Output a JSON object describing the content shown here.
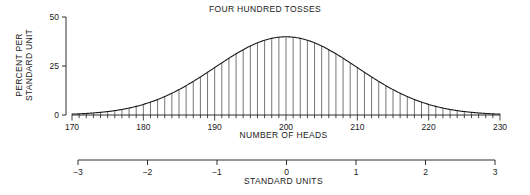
{
  "chart_data": {
    "type": "bar",
    "title": "FOUR HUNDRED TOSSES",
    "xlabel": "NUMBER OF HEADS",
    "ylabel": "PERCENT PER STANDARD UNIT",
    "ylabel_line1": "PERCENT PER",
    "ylabel_line2": "STANDARD UNIT",
    "secondary_xlabel": "STANDARD UNITS",
    "grid": false,
    "legend": "none",
    "xlim": [
      170,
      230
    ],
    "ylim": [
      0,
      50
    ],
    "secondary_xlim": [
      -3,
      3
    ],
    "x_ticks": [
      170,
      180,
      190,
      200,
      210,
      220,
      230
    ],
    "x_tick_labels": [
      "170",
      "180",
      "190",
      "200",
      "210",
      "220",
      "230"
    ],
    "x_minor_tick_step": 1,
    "y_ticks": [
      0,
      25,
      50
    ],
    "y_tick_labels": [
      "0",
      "25",
      "50"
    ],
    "secondary_x_ticks": [
      -3,
      -2,
      -1,
      0,
      1,
      2,
      3
    ],
    "secondary_x_tick_labels": [
      "−3",
      "−2",
      "−1",
      "0",
      "1",
      "2",
      "3"
    ],
    "distribution": {
      "name": "normal-approximation-binomial",
      "mean_heads": 200,
      "sd_heads": 10,
      "n_tosses": 400,
      "bar_width_heads": 1,
      "peak_value": 39.9
    },
    "categories": [
      170,
      171,
      172,
      173,
      174,
      175,
      176,
      177,
      178,
      179,
      180,
      181,
      182,
      183,
      184,
      185,
      186,
      187,
      188,
      189,
      190,
      191,
      192,
      193,
      194,
      195,
      196,
      197,
      198,
      199,
      200,
      201,
      202,
      203,
      204,
      205,
      206,
      207,
      208,
      209,
      210,
      211,
      212,
      213,
      214,
      215,
      216,
      217,
      218,
      219,
      220,
      221,
      222,
      223,
      224,
      225,
      226,
      227,
      228,
      229,
      230
    ],
    "values": [
      0.44,
      0.6,
      0.79,
      1.04,
      1.36,
      1.75,
      2.24,
      2.83,
      3.55,
      4.4,
      5.4,
      6.56,
      7.9,
      9.4,
      11.09,
      12.95,
      14.97,
      17.14,
      19.42,
      21.78,
      24.2,
      26.61,
      28.97,
      31.22,
      33.32,
      35.21,
      36.83,
      38.14,
      39.1,
      39.7,
      39.89,
      39.7,
      39.1,
      38.14,
      36.83,
      35.21,
      33.32,
      31.22,
      28.97,
      26.61,
      24.2,
      21.78,
      19.42,
      17.14,
      14.97,
      12.95,
      11.09,
      9.4,
      7.9,
      6.56,
      5.4,
      4.4,
      3.55,
      2.83,
      2.24,
      1.75,
      1.36,
      1.04,
      0.79,
      0.6,
      0.44
    ],
    "curve_description": "smooth normal curve traced along the tops of the bars"
  }
}
